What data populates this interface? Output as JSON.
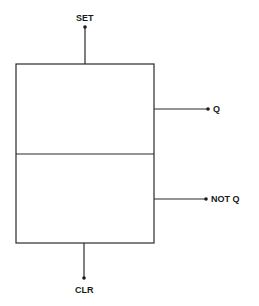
{
  "diagram": {
    "type": "flip-flop-block",
    "stroke_color": "#2a2a2a",
    "background": "#ffffff",
    "box": {
      "x": 16,
      "y": 64,
      "width": 138,
      "height": 179,
      "divider_y": 154
    },
    "inputs": {
      "set": {
        "label": "SET",
        "position": "top"
      },
      "clr": {
        "label": "CLR",
        "position": "bottom"
      }
    },
    "outputs": {
      "q": {
        "label": "Q",
        "position": "right-upper"
      },
      "not_q": {
        "label": "NOT Q",
        "position": "right-lower"
      }
    }
  }
}
